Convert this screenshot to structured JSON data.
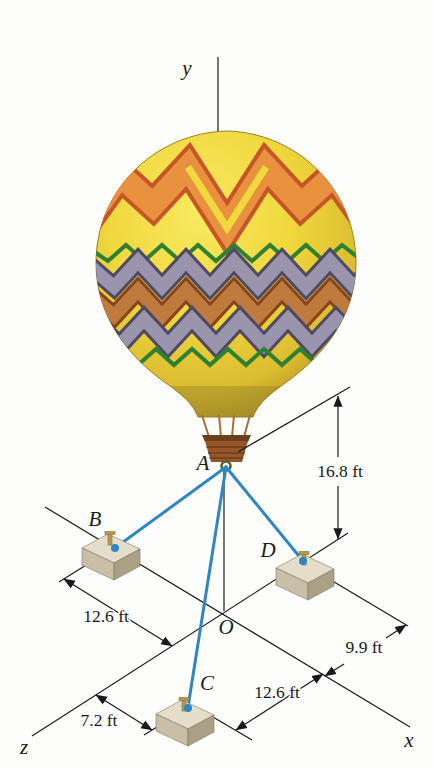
{
  "figure": {
    "type": "statics-textbook-diagram"
  },
  "axes": {
    "x": "x",
    "y": "y",
    "z": "z"
  },
  "points": {
    "a": "A",
    "b": "B",
    "c": "C",
    "d": "D",
    "o": "O"
  },
  "dimensions": {
    "height_a": "16.8 ft",
    "b_x": "12.6 ft",
    "d_z": "9.9 ft",
    "c_x": "7.2 ft",
    "c_z": "12.6 ft"
  },
  "geometry": {
    "cables": [
      "A to B",
      "A to C",
      "A to D"
    ],
    "balloon_point_height_ft": 16.8,
    "anchor_B_offset_along_x_ft": 12.6,
    "anchor_D_offset_along_z_ft": 9.9,
    "anchor_C_offset_along_x_ft": 7.2,
    "anchor_C_offset_along_z_ft": 12.6
  },
  "colors": {
    "cable_blue": "#2f86c3",
    "balloon_yellow": "#f0d83e",
    "crown_orange": "#e8923f",
    "crown_outline": "#c8552a",
    "band_purple": "#9a94ad",
    "band_purple_outline": "#4f4a63",
    "band_orange": "#bf7a3e",
    "band_orange_outline": "#84461e",
    "band_green": "#2e8033",
    "basket_brown": "#95562a",
    "anchor_block_tan": "#d9d1bc",
    "line_black": "#1a1a1a"
  }
}
